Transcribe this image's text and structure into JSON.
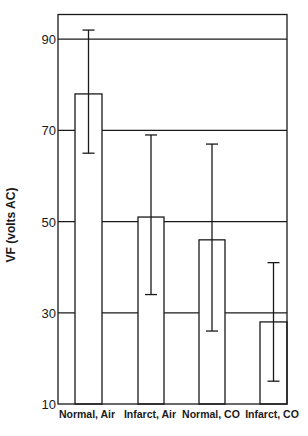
{
  "chart_data": {
    "type": "bar",
    "title": "",
    "xlabel": "",
    "ylabel": "VF (volts AC)",
    "categories": [
      "Normal, Air",
      "Infarct, Air",
      "Normal, CO",
      "Infarct, CO"
    ],
    "values": [
      78,
      51,
      46,
      28
    ],
    "error_bars": [
      {
        "low": 65,
        "high": 92
      },
      {
        "low": 34,
        "high": 69
      },
      {
        "low": 26,
        "high": 67
      },
      {
        "low": 15,
        "high": 41
      }
    ],
    "ylim": [
      10,
      95
    ],
    "yticks": [
      10,
      30,
      50,
      70,
      90
    ],
    "gridlines": [
      30,
      50,
      70,
      90
    ],
    "grid": true,
    "legend": null
  },
  "layout": {
    "frame": {
      "left": 58,
      "right": 287,
      "top": 14.5,
      "bottom": 404
    },
    "y_pixel_per_unit": 4.56,
    "bars": [
      {
        "x0": 75,
        "x1": 102,
        "label_x": 87
      },
      {
        "x0": 138,
        "x1": 164,
        "label_x": 150
      },
      {
        "x0": 199,
        "x1": 225,
        "label_x": 211
      },
      {
        "x0": 260,
        "x1": 287,
        "label_x": 272
      }
    ],
    "colors": {
      "line": "#1a1a1a",
      "bar_fill": "#ffffff",
      "background": "#ffffff"
    }
  }
}
